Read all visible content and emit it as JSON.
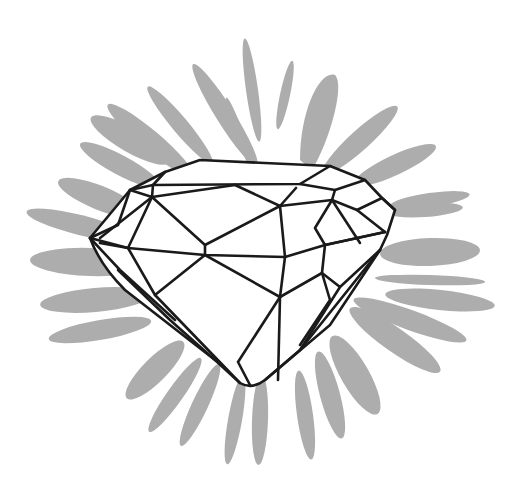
{
  "illustration": {
    "subject": "Faceted diamond line drawing with gray starburst background",
    "colors": {
      "background": "#ffffff",
      "burst": "#a9a9a9",
      "outline": "#1a1a1a",
      "facet_fill": "#ffffff"
    }
  }
}
